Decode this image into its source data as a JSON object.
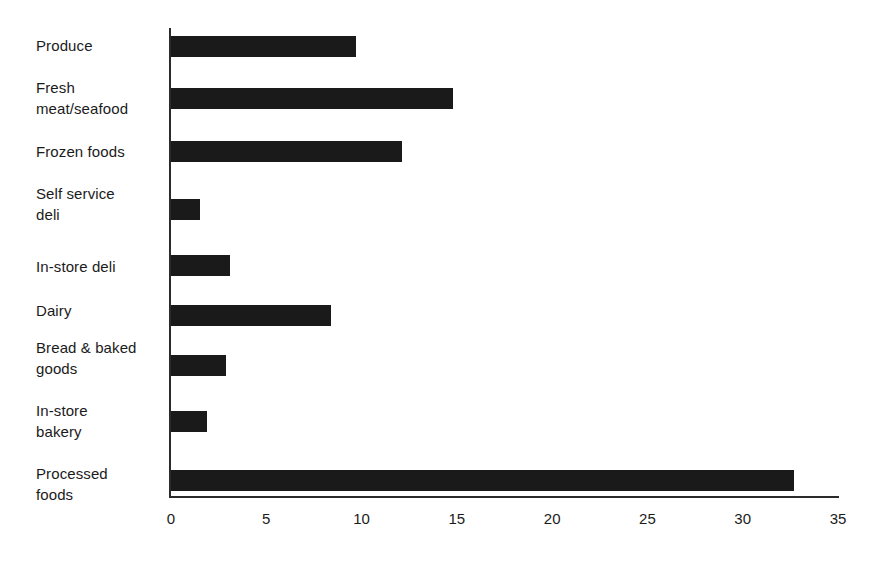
{
  "chart_data": {
    "type": "bar",
    "orientation": "horizontal",
    "title": "",
    "subtitle": "",
    "xlabel": "",
    "ylabel": "",
    "categories": [
      "Produce",
      "Fresh meat/seafood",
      "Frozen foods",
      "Self service deli",
      "In-store deli",
      "Dairy",
      "Bread & baked goods",
      "In-store bakery",
      "Processed foods"
    ],
    "category_lines": [
      [
        "Produce"
      ],
      [
        "Fresh",
        "meat/seafood"
      ],
      [
        "Frozen foods"
      ],
      [
        "Self service",
        "deli"
      ],
      [
        "In-store deli"
      ],
      [
        "Dairy"
      ],
      [
        "Bread & baked",
        "goods"
      ],
      [
        "In-store",
        "bakery"
      ],
      [
        "Processed",
        "foods"
      ]
    ],
    "values": [
      9.7,
      14.8,
      12.1,
      1.5,
      3.1,
      8.4,
      2.9,
      1.9,
      32.7
    ],
    "xlim": [
      0,
      35
    ],
    "xticks": [
      0,
      5,
      10,
      15,
      20,
      25,
      30,
      35
    ],
    "xtick_labels": [
      "0",
      "5",
      "10",
      "15",
      "20",
      "25",
      "30",
      "35"
    ],
    "grid": false,
    "legend": false,
    "legend_position": "none",
    "bar_color": "#1a1a1a",
    "axis_color": "#2b2b2b",
    "background_color": "#ffffff"
  }
}
